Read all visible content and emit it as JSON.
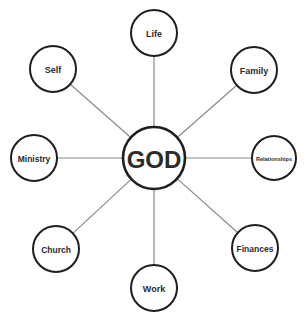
{
  "diagram": {
    "type": "hub-and-spoke",
    "center": {
      "id": "god",
      "label": "GOD",
      "cx": 154,
      "cy": 158,
      "r": 31,
      "font_size": 24
    },
    "nodes": [
      {
        "id": "life",
        "label": "Life",
        "cx": 154,
        "cy": 33,
        "r": 23,
        "font_size": 9
      },
      {
        "id": "family",
        "label": "Family",
        "cx": 254,
        "cy": 70,
        "r": 23,
        "font_size": 9
      },
      {
        "id": "relationships",
        "label": "Relationships",
        "cx": 274,
        "cy": 158,
        "r": 22,
        "font_size": 5.5
      },
      {
        "id": "finances",
        "label": "Finances",
        "cx": 255,
        "cy": 248,
        "r": 23,
        "font_size": 8.5
      },
      {
        "id": "work",
        "label": "Work",
        "cx": 154,
        "cy": 288,
        "r": 23,
        "font_size": 9
      },
      {
        "id": "church",
        "label": "Church",
        "cx": 56,
        "cy": 249,
        "r": 23,
        "font_size": 8.5
      },
      {
        "id": "ministry",
        "label": "Ministry",
        "cx": 34,
        "cy": 158,
        "r": 23,
        "font_size": 8.5
      },
      {
        "id": "self",
        "label": "Self",
        "cx": 53,
        "cy": 69,
        "r": 23,
        "font_size": 9
      }
    ],
    "colors": {
      "circle_stroke": "#1e1e1e",
      "connector": "#8a8a8a",
      "text": "#2b2b2b",
      "background": "#ffffff"
    }
  }
}
